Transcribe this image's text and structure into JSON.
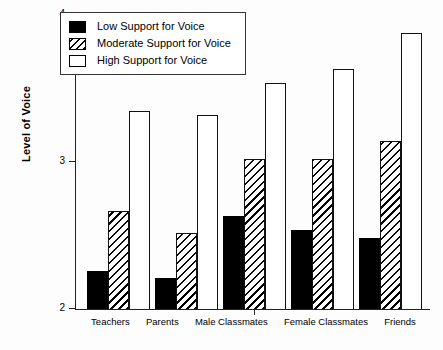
{
  "chart_data": {
    "type": "bar",
    "title": "",
    "xlabel": "",
    "ylabel": "Level of Voice",
    "ylim": [
      2,
      4
    ],
    "yticks": [
      2,
      3,
      4
    ],
    "ytick_labels": [
      "2",
      "3",
      "4"
    ],
    "grid": false,
    "legend_position": "top-left",
    "categories": [
      "Teachers",
      "Parents",
      "Male Classmates",
      "Female Classmates",
      "Friends"
    ],
    "series": [
      {
        "name": "Low Support for Voice",
        "fill": "solid-black",
        "values": [
          2.26,
          2.21,
          2.63,
          2.54,
          2.48
        ]
      },
      {
        "name": "Moderate Support for Voice",
        "fill": "diagonal-hatch",
        "values": [
          2.67,
          2.52,
          3.02,
          3.02,
          3.14
        ]
      },
      {
        "name": "High Support for Voice",
        "fill": "white",
        "values": [
          3.35,
          3.32,
          3.54,
          3.63,
          3.88
        ]
      }
    ]
  }
}
